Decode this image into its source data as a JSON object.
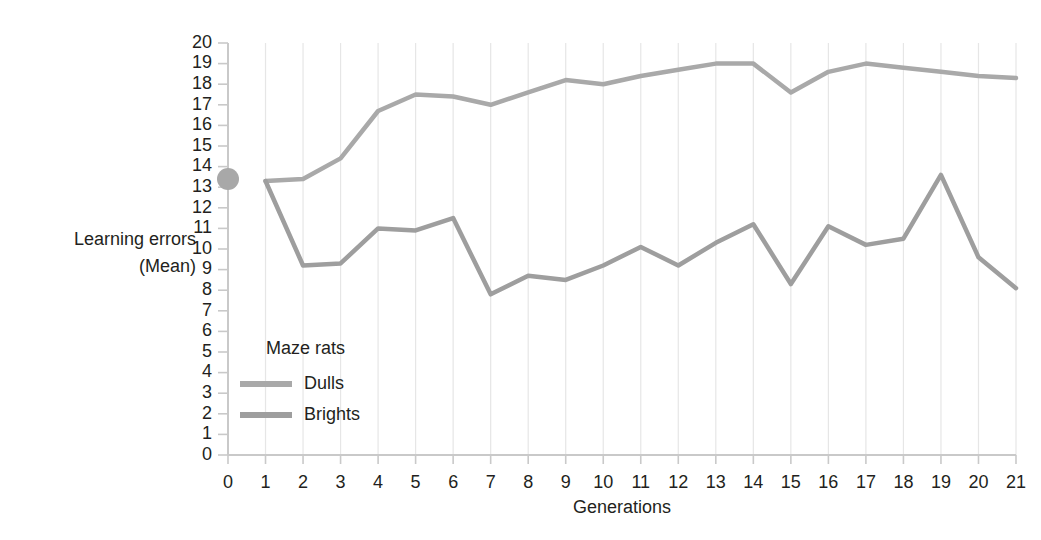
{
  "chart_data": {
    "type": "line",
    "title": "",
    "xlabel": "Generations",
    "ylabel": "Learning errors\n(Mean)",
    "ylabel_line1": "Learning errors",
    "ylabel_line2": "(Mean)",
    "xlim": [
      0,
      21
    ],
    "ylim": [
      0,
      20
    ],
    "grid": "vertical-light",
    "legend_position": "inside-lower-left",
    "legend_title": "Maze rats",
    "x": [
      0,
      1,
      2,
      3,
      4,
      5,
      6,
      7,
      8,
      9,
      10,
      11,
      12,
      13,
      14,
      15,
      16,
      17,
      18,
      19,
      20,
      21
    ],
    "xticks": [
      "0",
      "1",
      "2",
      "3",
      "4",
      "5",
      "6",
      "7",
      "8",
      "9",
      "10",
      "11",
      "12",
      "13",
      "14",
      "15",
      "16",
      "17",
      "18",
      "19",
      "20",
      "21"
    ],
    "yticks": [
      "0",
      "1",
      "2",
      "3",
      "4",
      "5",
      "6",
      "7",
      "8",
      "9",
      "10",
      "11",
      "12",
      "13",
      "14",
      "15",
      "16",
      "17",
      "18",
      "19",
      "20"
    ],
    "baseline_marker": {
      "label": "generation 0 baseline",
      "x": 0,
      "y": 13.4,
      "shape": "filled-circle",
      "color": "#a8a8a8"
    },
    "series": [
      {
        "name": "Dulls",
        "color": "#a9a9a9",
        "x": [
          1,
          2,
          3,
          4,
          5,
          6,
          7,
          8,
          9,
          10,
          11,
          12,
          13,
          14,
          15,
          16,
          17,
          18,
          19,
          20,
          21
        ],
        "values": [
          13.3,
          13.4,
          14.4,
          16.7,
          17.5,
          17.4,
          17.0,
          17.6,
          18.2,
          18.0,
          18.4,
          18.7,
          19.0,
          19.0,
          17.6,
          18.6,
          19.0,
          18.8,
          18.6,
          18.4,
          18.3
        ]
      },
      {
        "name": "Brights",
        "color": "#9e9e9e",
        "x": [
          1,
          2,
          3,
          4,
          5,
          6,
          7,
          8,
          9,
          10,
          11,
          12,
          13,
          14,
          15,
          16,
          17,
          18,
          19,
          20,
          21
        ],
        "values": [
          13.3,
          9.2,
          9.3,
          11.0,
          10.9,
          11.5,
          7.8,
          8.7,
          8.5,
          9.2,
          10.1,
          9.2,
          10.3,
          11.2,
          8.3,
          11.1,
          10.2,
          10.5,
          13.6,
          9.6,
          8.1
        ]
      }
    ]
  }
}
